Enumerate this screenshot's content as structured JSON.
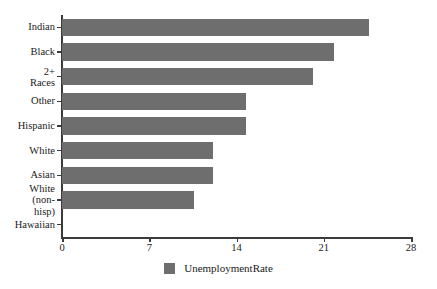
{
  "chart_data": {
    "type": "bar",
    "orientation": "horizontal",
    "title": "",
    "xlabel": "",
    "ylabel": "",
    "categories": [
      "Indian",
      "Black",
      "2+ Races",
      "Other",
      "Hispanic",
      "White",
      "Asian",
      "White\n(non-hisp)",
      "Hawaiian"
    ],
    "series": [
      {
        "name": "UnemploymentRate",
        "color": "#6e6e6e",
        "values": [
          24.6,
          21.8,
          20.1,
          14.8,
          14.8,
          12.1,
          12.1,
          10.6,
          0
        ]
      }
    ],
    "xlim": [
      0,
      28
    ],
    "xticks": [
      0,
      7,
      14,
      21,
      28
    ],
    "xtick_labels": [
      "0",
      "7",
      "14",
      "21",
      "28"
    ],
    "grid": false,
    "legend": {
      "position": "bottom-center",
      "entries": [
        {
          "label": "UnemploymentRate",
          "color": "#6e6e6e"
        }
      ]
    },
    "axis_color": "#3b3b3b",
    "background": "#ffffff"
  }
}
